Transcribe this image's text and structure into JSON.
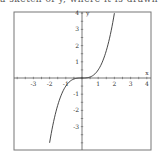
{
  "header": {
    "cutoff_text": "a sketch of y, where it is drawn using"
  },
  "chart_data": {
    "type": "line",
    "title": "",
    "xlabel": "x",
    "ylabel": "y",
    "xlim": [
      -4,
      4
    ],
    "ylim": [
      -4,
      4
    ],
    "grid": false,
    "x_ticks": [
      -3,
      -2,
      -1,
      1,
      2,
      3,
      4
    ],
    "y_ticks": [
      -3,
      -2,
      -1,
      1,
      2,
      3,
      4
    ],
    "series": [
      {
        "name": "y = x^3 / 2",
        "x": [
          -2,
          -1.5,
          -1,
          -0.5,
          0,
          0.5,
          1,
          1.5,
          2
        ],
        "y": [
          -4,
          -1.69,
          -0.5,
          -0.06,
          0,
          0.06,
          0.5,
          1.69,
          4
        ]
      }
    ],
    "colors": {
      "curve": "#333333",
      "axes": "#555555",
      "frame": "#777777"
    }
  }
}
